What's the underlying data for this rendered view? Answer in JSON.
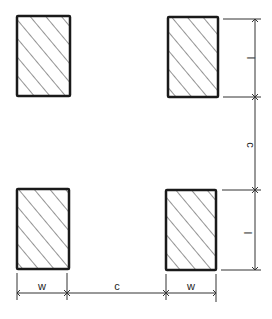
{
  "diagram": {
    "type": "land-pattern-dimension-drawing",
    "colors": {
      "background": "#ffffff",
      "stroke": "#1a1a1a",
      "hatch": "#3a3a3a",
      "dimension": "#333333"
    },
    "pads": [
      {
        "id": "pad-top-left",
        "x": 17,
        "y": 16,
        "w": 53,
        "h": 80
      },
      {
        "id": "pad-top-right",
        "x": 168,
        "y": 17,
        "w": 50,
        "h": 80
      },
      {
        "id": "pad-bottom-left",
        "x": 17,
        "y": 189,
        "w": 52,
        "h": 80
      },
      {
        "id": "pad-bottom-right",
        "x": 166,
        "y": 190,
        "w": 50,
        "h": 80
      }
    ],
    "vertical_dimensions": {
      "labels": [
        "l",
        "c",
        "l"
      ]
    },
    "horizontal_dimensions": {
      "labels": [
        "w",
        "c",
        "w"
      ]
    }
  }
}
